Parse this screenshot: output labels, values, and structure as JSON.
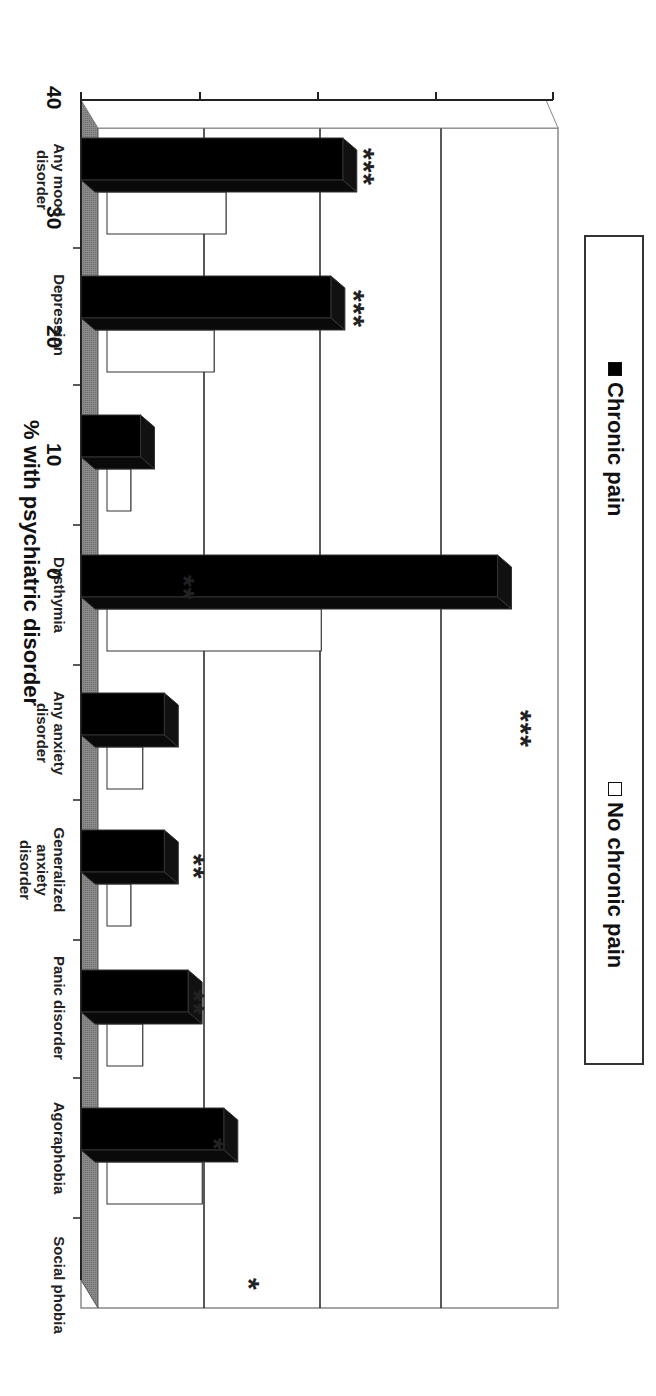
{
  "chart_data": {
    "type": "bar",
    "orientation": "rotated-90-clockwise",
    "title": "",
    "xlabel": "",
    "ylabel": "% with psychiatric disorder",
    "ylim": [
      0,
      40
    ],
    "yticks": [
      "0",
      "10",
      "20",
      "30",
      "40"
    ],
    "grid": true,
    "legend_position": "top (rotated: left side)",
    "categories": [
      "Any mood disorder",
      "Depression",
      "Dysthymia",
      "Any anxiety disorder",
      "Generalized anxiety disorder",
      "Panic disorder",
      "Agoraphobia",
      "Social phobia"
    ],
    "series": [
      {
        "name": "Chronic pain",
        "color": "#000000",
        "values": [
          22,
          21,
          5,
          35,
          7,
          7,
          9,
          12
        ]
      },
      {
        "name": "No chronic pain",
        "color": "#ffffff",
        "values": [
          10,
          9,
          2,
          18,
          3,
          2,
          3,
          8
        ]
      }
    ],
    "annotations": [
      "***",
      "***",
      "**",
      "***",
      "**",
      "**",
      "*",
      "*"
    ]
  },
  "legend": {
    "chronic": "Chronic pain",
    "no_chronic": "No chronic pain"
  },
  "axis": {
    "ylabel": "% with psychiatric disorder",
    "ticks": [
      "0",
      "10",
      "20",
      "30",
      "40"
    ]
  },
  "labels": {
    "c0a": "Any mood",
    "c0b": "disorder",
    "c1a": "Depression",
    "c2a": "Dysthymia",
    "c3a": "Any anxiety",
    "c3b": "disorder",
    "c4a": "Generalized",
    "c4b": "anxiety",
    "c4c": "disorder",
    "c5a": "Panic disorder",
    "c6a": "Agoraphobia",
    "c7a": "Social phobia"
  },
  "stars": {
    "s0": "***",
    "s1": "***",
    "s2": "**",
    "s3": "***",
    "s4": "**",
    "s5": "**",
    "s6": "*",
    "s7": "*"
  }
}
